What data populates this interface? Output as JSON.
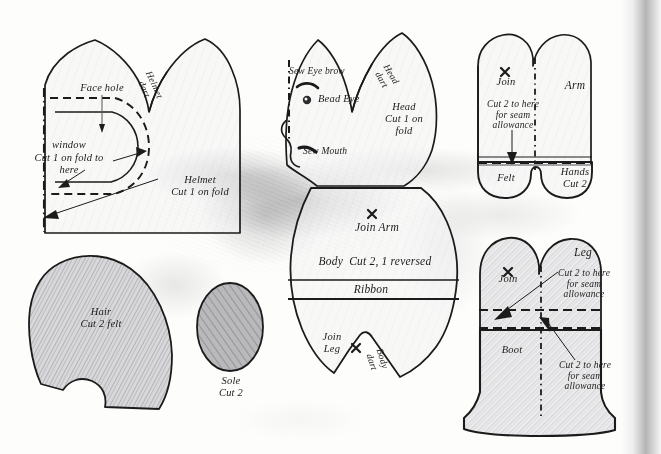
{
  "page": {
    "kind": "sewing-pattern-sheet",
    "background_color": "#fdfdfc",
    "ink_color": "#1b1b1b",
    "pencil_shade_color": "#6e6e72",
    "gutter_shadow_color": "#78787c",
    "width": 661,
    "height": 454
  },
  "pieces": [
    {
      "id": "helmet",
      "name": "Helmet pattern piece",
      "labels": {
        "face_hole": "Face hole",
        "window": "window",
        "window_note": "Cut 1 on fold to\nhere",
        "dart": "Helmet\ndart",
        "main": "Helmet\nCut 1 on fold"
      }
    },
    {
      "id": "head",
      "name": "Head pattern piece",
      "labels": {
        "eyebrow": "Sew Eye brow",
        "bead_eye": "Bead Eye",
        "mouth": "Sew Mouth",
        "dart": "Head\ndart",
        "main": "Head\nCut 1 on\nfold"
      }
    },
    {
      "id": "arm",
      "name": "Arm pattern piece",
      "labels": {
        "join": "Join",
        "main": "Arm",
        "seam_note": "Cut 2 to here\nfor seam\nallowance",
        "felt": "Felt",
        "hands": "Hands\nCut 2"
      }
    },
    {
      "id": "body",
      "name": "Body pattern piece",
      "labels": {
        "join_arm": "Join Arm",
        "main": "Body  Cut 2, 1 reversed",
        "ribbon": "Ribbon",
        "join_leg": "Join\nLeg",
        "dart": "Body\ndart"
      }
    },
    {
      "id": "leg",
      "name": "Leg and boot pattern piece",
      "labels": {
        "main": "Leg",
        "join": "Join",
        "seam_note_top": "Cut 2 to here\nfor seam\nallowance",
        "boot": "Boot",
        "seam_note_bottom": "Cut 2 to here\nfor seam\nallowance"
      }
    },
    {
      "id": "hair",
      "name": "Hair pattern piece",
      "labels": {
        "main": "Hair\nCut 2 felt"
      }
    },
    {
      "id": "sole",
      "name": "Sole pattern piece",
      "labels": {
        "main": "Sole\nCut 2"
      }
    }
  ]
}
